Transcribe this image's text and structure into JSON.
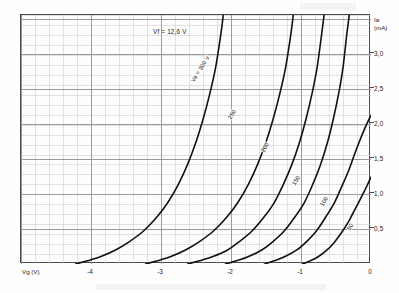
{
  "figure": {
    "background": "#fdfdfd",
    "frame_color": "#4a4a4a",
    "curve_color": "#111111",
    "grid_minor_color": "#cfcfcf",
    "grid_major_color": "#9a9a9a"
  },
  "annotations": {
    "condition": "Vf = 12,6 V"
  },
  "axes": {
    "y_title_line1": "Ia",
    "y_title_line2": "(mA)",
    "x_title": "Vg (V)"
  },
  "chart_data": {
    "type": "line",
    "title": "",
    "subtitle": "",
    "xlabel": "Vg (V)",
    "ylabel": "Ia (mA)",
    "xlim": [
      -5,
      0
    ],
    "ylim": [
      0,
      3.55
    ],
    "grid": true,
    "grid_minor_step_x": 0.2,
    "grid_minor_step_y": 0.1419,
    "grid_major_step_x": 1.0,
    "grid_major_step_y": 0.5,
    "legend_position": "inline-curve-labels",
    "xticks": [
      -4,
      -3,
      -2,
      -1,
      0
    ],
    "xticklabels": [
      "-4",
      "-3",
      "-2",
      "-1",
      "0"
    ],
    "yticks": [
      0.5,
      1.0,
      1.5,
      2.0,
      2.5,
      3.0
    ],
    "yticklabels": [
      "0,5",
      "1,0",
      "1,5",
      "2,0",
      "2,5",
      "3,0"
    ],
    "annotations": [
      "Vf = 12,6 V"
    ],
    "series": [
      {
        "name": "Va = 300 V",
        "label": "Va = 300 V",
        "label_x": -2.55,
        "label_y": 2.62,
        "label_rotation": -58,
        "x": [
          -4.22,
          -4.05,
          -3.85,
          -3.65,
          -3.45,
          -3.25,
          -3.05,
          -2.9,
          -2.75,
          -2.62,
          -2.5,
          -2.4,
          -2.3,
          -2.22,
          -2.15,
          -2.11
        ],
        "y": [
          0.0,
          0.045,
          0.11,
          0.2,
          0.32,
          0.47,
          0.68,
          0.88,
          1.14,
          1.42,
          1.74,
          2.06,
          2.44,
          2.8,
          3.24,
          3.55
        ]
      },
      {
        "name": "250",
        "label": "250",
        "label_x": -2.02,
        "label_y": 2.1,
        "label_rotation": -58,
        "x": [
          -3.22,
          -3.05,
          -2.85,
          -2.65,
          -2.45,
          -2.25,
          -2.05,
          -1.9,
          -1.75,
          -1.62,
          -1.5,
          -1.4,
          -1.3,
          -1.22,
          -1.15,
          -1.11
        ],
        "y": [
          0.0,
          0.045,
          0.11,
          0.2,
          0.32,
          0.47,
          0.68,
          0.88,
          1.14,
          1.42,
          1.74,
          2.06,
          2.44,
          2.8,
          3.24,
          3.55
        ]
      },
      {
        "name": "200",
        "label": "200",
        "label_x": -1.55,
        "label_y": 1.62,
        "label_rotation": -58,
        "x": [
          -2.62,
          -2.45,
          -2.25,
          -2.05,
          -1.88,
          -1.7,
          -1.52,
          -1.38,
          -1.25,
          -1.13,
          -1.02,
          -0.93,
          -0.84,
          -0.77,
          -0.71,
          -0.67
        ],
        "y": [
          0.0,
          0.045,
          0.11,
          0.2,
          0.32,
          0.47,
          0.68,
          0.88,
          1.14,
          1.42,
          1.74,
          2.06,
          2.44,
          2.8,
          3.24,
          3.55
        ]
      },
      {
        "name": "150",
        "label": "150",
        "label_x": -1.1,
        "label_y": 1.16,
        "label_rotation": -58,
        "x": [
          -2.08,
          -1.92,
          -1.74,
          -1.56,
          -1.4,
          -1.24,
          -1.08,
          -0.95,
          -0.83,
          -0.72,
          -0.62,
          -0.54,
          -0.46,
          -0.4,
          -0.35,
          -0.31
        ],
        "y": [
          0.0,
          0.045,
          0.11,
          0.2,
          0.32,
          0.47,
          0.68,
          0.88,
          1.14,
          1.42,
          1.74,
          2.06,
          2.44,
          2.8,
          3.24,
          3.55
        ]
      },
      {
        "name": "100",
        "label": "100",
        "label_x": -0.7,
        "label_y": 0.86,
        "label_rotation": -58,
        "x": [
          -1.52,
          -1.38,
          -1.22,
          -1.06,
          -0.92,
          -0.78,
          -0.64,
          -0.52,
          -0.42,
          -0.32,
          -0.24,
          -0.16,
          -0.09,
          -0.03,
          0.0
        ],
        "y": [
          0.0,
          0.045,
          0.11,
          0.2,
          0.32,
          0.47,
          0.68,
          0.88,
          1.1,
          1.33,
          1.55,
          1.76,
          1.93,
          2.06,
          2.12
        ]
      },
      {
        "name": "50",
        "label": "50",
        "label_x": -0.32,
        "label_y": 0.52,
        "label_rotation": -58,
        "x": [
          -0.98,
          -0.88,
          -0.76,
          -0.64,
          -0.54,
          -0.44,
          -0.34,
          -0.26,
          -0.18,
          -0.11,
          -0.05,
          0.0
        ],
        "y": [
          0.0,
          0.04,
          0.1,
          0.19,
          0.29,
          0.42,
          0.57,
          0.72,
          0.87,
          1.01,
          1.13,
          1.24
        ]
      }
    ]
  }
}
